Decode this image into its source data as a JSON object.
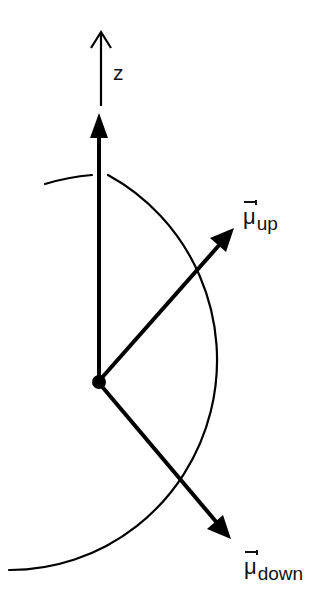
{
  "diagram": {
    "title": "",
    "axis": {
      "label": "z"
    },
    "vectors": {
      "mu_up": {
        "symbol": "μ",
        "subscript": "up"
      },
      "mu_down": {
        "symbol": "μ",
        "subscript": "down"
      }
    },
    "colors": {
      "stroke": "#000000",
      "text": "#111111",
      "background": "#ffffff"
    }
  }
}
